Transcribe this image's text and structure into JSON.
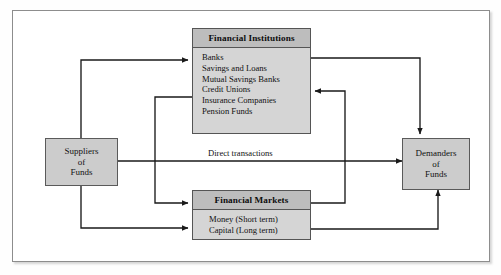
{
  "diagram": {
    "frame": {
      "border_color": "#8d8d8d",
      "background": "#ffffff"
    },
    "palette": {
      "node_fill": "#cccccc",
      "panel_body_fill": "#d5d5d5",
      "panel_header_fill": "#bdbdbd",
      "border": "#555555",
      "wire": "#1a1a1a"
    },
    "nodes": {
      "suppliers": {
        "lines": [
          "Suppliers",
          "of",
          "Funds"
        ]
      },
      "demanders": {
        "lines": [
          "Demanders",
          "of",
          "Funds"
        ]
      },
      "institutions": {
        "header": "Financial Institutions",
        "items": [
          "Banks",
          "Savings and Loans",
          "Mutual Savings Banks",
          "Credit Unions",
          "Insurance Companies",
          "Pension Funds"
        ]
      },
      "markets": {
        "header": "Financial Markets",
        "items": [
          "Money (Short term)",
          "Capital (Long term)"
        ]
      }
    },
    "labels": {
      "direct_transactions": "Direct transactions"
    },
    "flows": [
      {
        "name": "suppliers-to-institutions",
        "from": "Suppliers of Funds",
        "to": "Financial Institutions"
      },
      {
        "name": "suppliers-to-markets",
        "from": "Suppliers of Funds",
        "to": "Financial Markets"
      },
      {
        "name": "suppliers-to-demanders-direct",
        "from": "Suppliers of Funds",
        "to": "Demanders of Funds",
        "label": "Direct transactions"
      },
      {
        "name": "institutions-to-demanders",
        "from": "Financial Institutions",
        "to": "Demanders of Funds"
      },
      {
        "name": "institutions-to-markets",
        "from": "Financial Institutions",
        "to": "Financial Markets"
      },
      {
        "name": "markets-to-demanders",
        "from": "Financial Markets",
        "to": "Demanders of Funds"
      },
      {
        "name": "markets-to-institutions",
        "from": "Financial Markets",
        "to": "Financial Institutions"
      }
    ]
  }
}
